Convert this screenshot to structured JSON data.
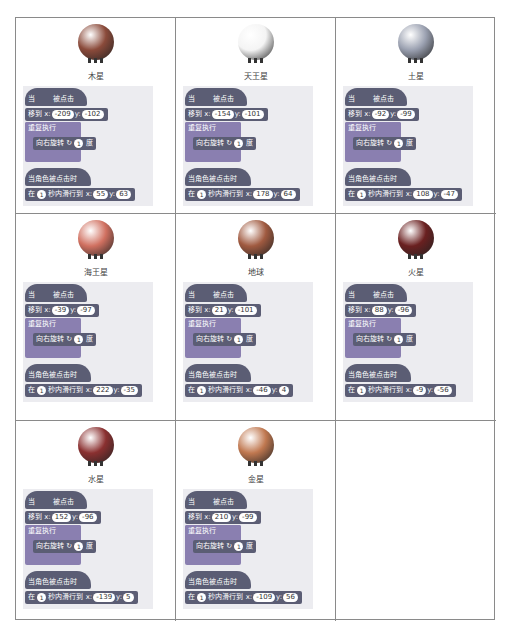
{
  "labels": {
    "when_clicked_a": "当",
    "when_clicked_b": "被点击",
    "goto": "移到 x:",
    "y": "y:",
    "forever": "重复执行",
    "turn_right": "向右旋转",
    "degrees": "度",
    "when_sprite_clicked": "当角色被点击时",
    "glide_a": "在",
    "glide_b": "秒内滑行到 x:",
    "turn_icon": "↻"
  },
  "cells": [
    {
      "name": "木星",
      "color": "#8a4a3a",
      "goto_x": "-209",
      "goto_y": "-102",
      "turn": "1",
      "glide_secs": "1",
      "glide_x": "55",
      "glide_y": "63"
    },
    {
      "name": "天王星",
      "color": "#f4f4f4",
      "goto_x": "-154",
      "goto_y": "-101",
      "turn": "1",
      "glide_secs": "1",
      "glide_x": "178",
      "glide_y": "64"
    },
    {
      "name": "土星",
      "color": "#9aa0b0",
      "goto_x": "-92",
      "goto_y": "-99",
      "turn": "1",
      "glide_secs": "1",
      "glide_x": "108",
      "glide_y": "-47"
    },
    {
      "name": "海王星",
      "color": "#d07060",
      "goto_x": "-39",
      "goto_y": "-97",
      "turn": "1",
      "glide_secs": "1",
      "glide_x": "222",
      "glide_y": "-35"
    },
    {
      "name": "地球",
      "color": "#a05a40",
      "goto_x": "21",
      "goto_y": "-101",
      "turn": "1",
      "glide_secs": "1",
      "glide_x": "-46",
      "glide_y": "4"
    },
    {
      "name": "火星",
      "color": "#6a2020",
      "goto_x": "88",
      "goto_y": "-96",
      "turn": "1",
      "glide_secs": "1",
      "glide_x": "-9",
      "glide_y": "-56"
    },
    {
      "name": "水星",
      "color": "#8a3030",
      "goto_x": "152",
      "goto_y": "-96",
      "turn": "1",
      "glide_secs": "1",
      "glide_x": "-139",
      "glide_y": "5"
    },
    {
      "name": "金星",
      "color": "#c07850",
      "goto_x": "210",
      "goto_y": "-99",
      "turn": "1",
      "glide_secs": "1",
      "glide_x": "-109",
      "glide_y": "56"
    }
  ]
}
